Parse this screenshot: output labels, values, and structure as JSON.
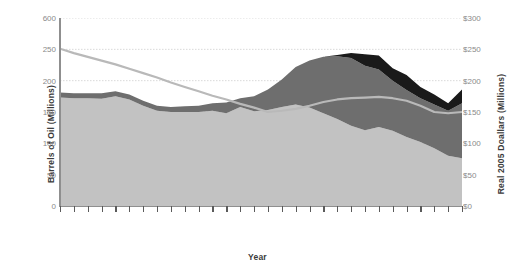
{
  "axes": {
    "y_left_title": "Barrels of Oil (Millions)",
    "y_right_title": "Real 2005 Doallars (Millions)",
    "x_title": "Year",
    "y_left_ticks": [
      "600",
      "250",
      "200",
      "150",
      "100",
      "50",
      "0"
    ],
    "y_right_ticks": [
      "$300",
      "$250",
      "$200",
      "$150",
      "$100",
      "$50",
      "$0"
    ]
  },
  "colors": {
    "band_light": "#c2c2c2",
    "band_dark": "#6e6e6e",
    "band_black": "#1a1a1a",
    "overlay_line": "#b9b9b9",
    "axis": "#8f8f8f",
    "gridline": "#d9d9d9",
    "tick_text": "#8a8a8a",
    "title_text": "#3b3b3b"
  },
  "chart_data": {
    "type": "area",
    "title": "",
    "xlabel": "Year",
    "ylabel": "Barrels of Oil (Millions)",
    "ylabel_right": "Real 2005 Doallars (Millions)",
    "ylim": [
      0,
      300
    ],
    "ylim_right": [
      0,
      300
    ],
    "grid": true,
    "legend_position": "none",
    "stacked": true,
    "x": [
      1,
      2,
      3,
      4,
      5,
      6,
      7,
      8,
      9,
      10,
      11,
      12,
      13,
      14,
      15,
      16,
      17,
      18,
      19,
      20,
      21,
      22,
      23,
      24,
      25,
      26,
      27,
      28,
      29,
      30
    ],
    "series": [
      {
        "name": "band-light-bottom",
        "stack_order": 1,
        "color": "#c2c2c2",
        "values": [
          173,
          172,
          172,
          171,
          175,
          170,
          160,
          152,
          150,
          150,
          150,
          152,
          148,
          158,
          151,
          153,
          158,
          162,
          157,
          148,
          139,
          128,
          121,
          126,
          120,
          110,
          102,
          92,
          80,
          76
        ]
      },
      {
        "name": "band-dark-middle",
        "stack_order": 2,
        "color": "#6e6e6e",
        "values": [
          8,
          8,
          8,
          9,
          8,
          8,
          8,
          8,
          8,
          9,
          10,
          12,
          17,
          14,
          24,
          33,
          44,
          60,
          75,
          90,
          100,
          108,
          103,
          92,
          80,
          75,
          70,
          70,
          72,
          88
        ]
      },
      {
        "name": "band-black-top",
        "stack_order": 3,
        "color": "#1a1a1a",
        "values": [
          0,
          0,
          0,
          0,
          0,
          0,
          0,
          0,
          0,
          0,
          0,
          0,
          0,
          0,
          0,
          0,
          0,
          0,
          0,
          0,
          2,
          8,
          18,
          22,
          20,
          24,
          18,
          16,
          12,
          22
        ]
      }
    ],
    "overlay_line": {
      "name": "oil-price-line",
      "color": "#b9b9b9",
      "values": [
        251,
        244,
        238,
        232,
        226,
        219,
        212,
        205,
        197,
        190,
        183,
        176,
        170,
        163,
        157,
        150,
        152,
        155,
        160,
        166,
        170,
        172,
        173,
        174,
        172,
        168,
        160,
        150,
        148,
        150
      ]
    }
  }
}
